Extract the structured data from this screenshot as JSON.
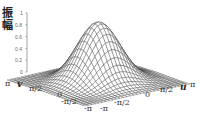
{
  "chart_data": {
    "type": "surface",
    "title": "",
    "zlabel": "振幅",
    "zlabel_chars": [
      "振",
      "幅"
    ],
    "xlabel": "u",
    "ylabel": "v",
    "zlim": [
      0,
      1
    ],
    "z_ticks": [
      "0",
      "0.2",
      "0.4",
      "0.6",
      "0.8",
      "1"
    ],
    "u_ticks": [
      "-π",
      "-π/2",
      "0",
      "π/2",
      "π"
    ],
    "v_ticks": [
      "π",
      "π/2",
      "0",
      "-π/2",
      "-π"
    ],
    "u_range": [
      -3.1416,
      3.1416
    ],
    "v_range": [
      -3.1416,
      3.1416
    ],
    "function": "gaussian bump, peak amplitude 1 at (u=0,v=0), ~0 at edges",
    "grid_lines": 31,
    "line_color": "#333333"
  }
}
